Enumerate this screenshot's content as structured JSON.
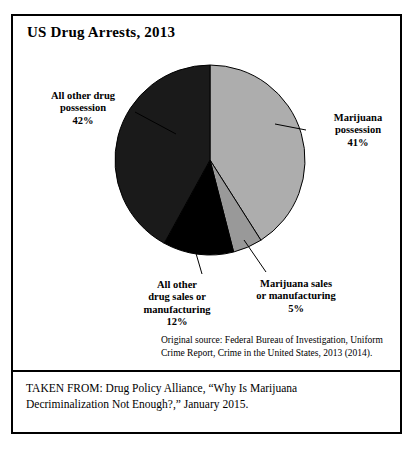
{
  "figure": {
    "title": "US Drug Arrests, 2013",
    "source_note": "Original source: Federal Bureau of Investigation, Uniform Crime Report, Crime in the United States, 2013 (2014).",
    "caption": "TAKEN FROM: Drug Policy Alliance, “Why Is Marijuana Decriminalization Not Enough?,” January 2015.",
    "frame_color": "#000000",
    "background_color": "#ffffff"
  },
  "labels": {
    "other_possession": "All other drug\npossession\n42%",
    "marijuana_possession": "Marijuana\npossession\n41%",
    "other_sales": "All other\ndrug sales or\nmanufacturing\n12%",
    "marijuana_sales": "Marijuana sales\nor manufacturing\n5%"
  },
  "chart_data": {
    "type": "pie",
    "title": "US Drug Arrests, 2013",
    "xlabel": "",
    "ylabel": "",
    "units": "percent",
    "total": 100,
    "start_angle_deg": 0,
    "direction": "clockwise",
    "legend": "none",
    "grid": false,
    "labels": [
      "Marijuana possession",
      "Marijuana sales or manufacturing",
      "All other drug sales or manufacturing",
      "All other drug possession"
    ],
    "values": [
      41,
      5,
      12,
      42
    ],
    "colors": [
      "#adadad",
      "#999999",
      "#000000",
      "#1a1a1a"
    ],
    "slices": [
      {
        "name": "Marijuana possession",
        "value": 41,
        "percent": "41%",
        "color": "#adadad",
        "start_deg": 0,
        "end_deg": 147.6
      },
      {
        "name": "Marijuana sales or manufacturing",
        "value": 5,
        "percent": "5%",
        "color": "#999999",
        "start_deg": 147.6,
        "end_deg": 165.6
      },
      {
        "name": "All other drug sales or manufacturing",
        "value": 12,
        "percent": "12%",
        "color": "#000000",
        "start_deg": 165.6,
        "end_deg": 208.8
      },
      {
        "name": "All other drug possession",
        "value": 42,
        "percent": "42%",
        "color": "#1a1a1a",
        "start_deg": 208.8,
        "end_deg": 360
      }
    ]
  },
  "geometry": {
    "cx": 197,
    "cy": 144,
    "r": 95,
    "stroke": "#000000",
    "stroke_width": 1
  },
  "leaders": [
    {
      "name": "leader-other-possession",
      "x1": 122,
      "y1": 96,
      "x2": 163,
      "y2": 118
    },
    {
      "name": "leader-marijuana-possession",
      "x1": 293,
      "y1": 114,
      "x2": 262,
      "y2": 108
    },
    {
      "name": "leader-other-sales",
      "x1": 189,
      "y1": 258,
      "x2": 182,
      "y2": 234
    },
    {
      "name": "leader-marijuana-sales",
      "x1": 253,
      "y1": 256,
      "x2": 231,
      "y2": 224
    }
  ]
}
